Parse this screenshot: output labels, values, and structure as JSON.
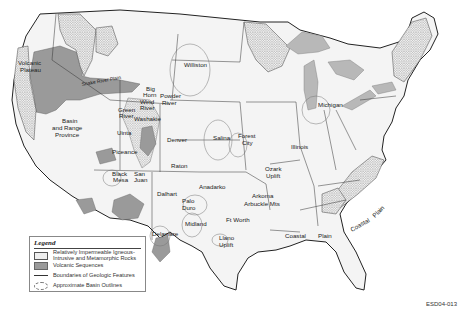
{
  "map": {
    "title": "Geologic features of the conterminous United States",
    "region_labels": [
      {
        "text": "Volcanic",
        "x": 18,
        "y": 65
      },
      {
        "text": "Plateau",
        "x": 20,
        "y": 72
      },
      {
        "text": "Snake River Plain",
        "x": 80,
        "y": 80
      },
      {
        "text": "Basin",
        "x": 62,
        "y": 123
      },
      {
        "text": "and Range",
        "x": 56,
        "y": 130
      },
      {
        "text": "Province",
        "x": 57,
        "y": 137
      },
      {
        "text": "Williston",
        "x": 184,
        "y": 67
      },
      {
        "text": "Big",
        "x": 134,
        "y": 90
      },
      {
        "text": "Horn",
        "x": 134,
        "y": 96
      },
      {
        "text": "Powder",
        "x": 156,
        "y": 100
      },
      {
        "text": "River",
        "x": 158,
        "y": 107
      },
      {
        "text": "Wind",
        "x": 134,
        "y": 105
      },
      {
        "text": "River",
        "x": 134,
        "y": 110
      },
      {
        "text": "Green",
        "x": 118,
        "y": 112
      },
      {
        "text": "River",
        "x": 119,
        "y": 118
      },
      {
        "text": "Washakie",
        "x": 135,
        "y": 120
      },
      {
        "text": "Uinta",
        "x": 117,
        "y": 135
      },
      {
        "text": "Denver",
        "x": 167,
        "y": 142
      },
      {
        "text": "Piceance",
        "x": 112,
        "y": 154
      },
      {
        "text": "Salina",
        "x": 213,
        "y": 140
      },
      {
        "text": "Forest",
        "x": 238,
        "y": 138
      },
      {
        "text": "City",
        "x": 242,
        "y": 145
      },
      {
        "text": "Raton",
        "x": 171,
        "y": 168
      },
      {
        "text": "Black",
        "x": 112,
        "y": 176
      },
      {
        "text": "Mesa",
        "x": 113,
        "y": 182
      },
      {
        "text": "San",
        "x": 134,
        "y": 176
      },
      {
        "text": "Juan",
        "x": 134,
        "y": 182
      },
      {
        "text": "Dalhart",
        "x": 157,
        "y": 196
      },
      {
        "text": "Anadarko",
        "x": 199,
        "y": 189
      },
      {
        "text": "Palo",
        "x": 186,
        "y": 203
      },
      {
        "text": "Duro",
        "x": 186,
        "y": 210
      },
      {
        "text": "Midland",
        "x": 185,
        "y": 226
      },
      {
        "text": "Delaware",
        "x": 153,
        "y": 236
      },
      {
        "text": "Ft Worth",
        "x": 226,
        "y": 222
      },
      {
        "text": "Llano",
        "x": 219,
        "y": 240
      },
      {
        "text": "Uplift",
        "x": 219,
        "y": 247
      },
      {
        "text": "Arkoma",
        "x": 252,
        "y": 198
      },
      {
        "text": "Arbuckle Mts",
        "x": 246,
        "y": 206
      },
      {
        "text": "Ozark",
        "x": 265,
        "y": 171
      },
      {
        "text": "Uplift",
        "x": 266,
        "y": 178
      },
      {
        "text": "Illinois",
        "x": 291,
        "y": 149
      },
      {
        "text": "Michigan",
        "x": 318,
        "y": 107
      },
      {
        "text": "Coastal",
        "x": 285,
        "y": 238
      },
      {
        "text": "Plain",
        "x": 318,
        "y": 238
      },
      {
        "text": "Coastal",
        "x": 357,
        "y": 226
      },
      {
        "text": "Plain",
        "x": 377,
        "y": 212
      }
    ],
    "image_code": "ESD04-013"
  },
  "legend": {
    "title": "Legend",
    "items": [
      {
        "swatch": "dotted-pattern",
        "label": "Relatively Impermeable Igneous-Intrusive and Metamorphic Rocks"
      },
      {
        "swatch": "gray-fill",
        "label": "Volcanic Sequences"
      },
      {
        "swatch": "solid-line",
        "label": "Boundaries of Geologic Features"
      },
      {
        "swatch": "dashed-oval",
        "label": "Approximate Basin Outlines"
      }
    ]
  },
  "colors": {
    "land": "#f4f4f4",
    "volcanic": "#9a9a9a",
    "igneous_dots": "#333333",
    "lakes": "#b8b8b8",
    "boundary": "#222222"
  }
}
